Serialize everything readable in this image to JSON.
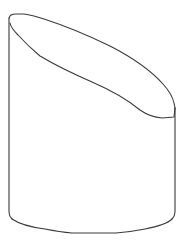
{
  "figure": {
    "stroke_color": "#3a3a3a",
    "background_color": "#ffffff"
  }
}
